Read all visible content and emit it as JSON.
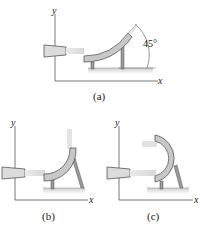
{
  "figures": [
    {
      "id": "a",
      "caption": "(a)",
      "axis_x": "x",
      "axis_y": "y",
      "angle_label": "45°",
      "description": "Water jet from nozzle deflected upward by curved vane at 45°"
    },
    {
      "id": "b",
      "caption": "(b)",
      "axis_x": "x",
      "axis_y": "y",
      "description": "Water jet deflected vertically upward by quarter-circle vane"
    },
    {
      "id": "c",
      "caption": "(c)",
      "axis_x": "x",
      "axis_y": "y",
      "description": "Water jet deflected back (reversed 180°) by semicircular vane"
    }
  ],
  "colors": {
    "vane_fill": "#c8c8c8",
    "vane_stroke": "#555555",
    "support": "#9a9a9a",
    "ground": "#d6d6d6",
    "jet": "#e4e4e4",
    "axis": "#444444"
  }
}
